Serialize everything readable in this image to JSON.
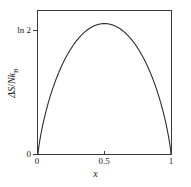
{
  "figure": {
    "background_color": "#ffffff",
    "curve_color": "#2b2b2b",
    "axis_color": "#3a3a3a"
  },
  "axes": {
    "xlabel": "x",
    "ylabel_parts": {
      "delta": "Δ",
      "s": "S",
      "slash": "/",
      "n": "N",
      "k": "k",
      "b": "B"
    },
    "ylabel_plain": "ΔS/Nk_B",
    "x_ticks": [
      {
        "value": 0,
        "label": "0"
      },
      {
        "value": 0.5,
        "label": "0.5"
      },
      {
        "value": 1,
        "label": "1"
      }
    ],
    "y_ticks": [
      {
        "value": 0,
        "label": "0"
      },
      {
        "value": 0.693,
        "label": "ln 2"
      }
    ]
  },
  "chart_data": {
    "type": "line",
    "title": "",
    "subtitle": "",
    "xlabel": "x",
    "ylabel": "ΔS/Nk_B",
    "xlim": [
      0,
      1
    ],
    "ylim": [
      0,
      0.76
    ],
    "grid": false,
    "legend": null,
    "xtick_labels": [
      "0",
      "0.5",
      "1"
    ],
    "xtick_values": [
      0,
      0.5,
      1
    ],
    "ytick_labels": [
      "0",
      "ln 2"
    ],
    "ytick_values": [
      0,
      0.693
    ],
    "series": [
      {
        "name": "entropy of mixing",
        "formula": "-(x ln x + (1-x) ln(1-x))",
        "x": [
          0,
          0.02,
          0.05,
          0.08,
          0.1,
          0.15,
          0.2,
          0.25,
          0.3,
          0.35,
          0.4,
          0.45,
          0.5,
          0.55,
          0.6,
          0.65,
          0.7,
          0.75,
          0.8,
          0.85,
          0.9,
          0.92,
          0.95,
          0.98,
          1
        ],
        "y": [
          0,
          0.098,
          0.199,
          0.282,
          0.325,
          0.423,
          0.5,
          0.562,
          0.611,
          0.647,
          0.673,
          0.688,
          0.693,
          0.688,
          0.673,
          0.647,
          0.611,
          0.562,
          0.5,
          0.423,
          0.325,
          0.279,
          0.199,
          0.098,
          0
        ]
      }
    ],
    "annotations": [
      {
        "text": "ln 2",
        "x": 0,
        "y": 0.693,
        "role": "y-tick-label"
      }
    ]
  }
}
